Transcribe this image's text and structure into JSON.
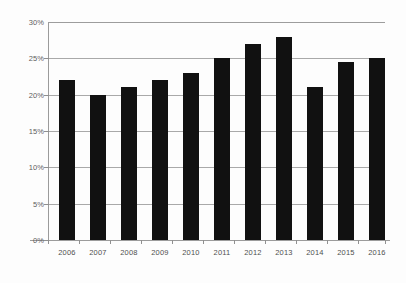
{
  "chart_data": {
    "type": "bar",
    "title": "",
    "subtitle": "",
    "xlabel": "",
    "ylabel": "",
    "categories": [
      "2006",
      "2007",
      "2008",
      "2009",
      "2010",
      "2011",
      "2012",
      "2013",
      "2014",
      "2015",
      "2016"
    ],
    "values": [
      22,
      20,
      21,
      22,
      23,
      25,
      27,
      28,
      21,
      24.5,
      25
    ],
    "value_labels": [
      "22%",
      "20%",
      "21%",
      "22%",
      "23%",
      "25%",
      "27%",
      "28%",
      "21%",
      "24.5%",
      "25%"
    ],
    "ylim": [
      0,
      30
    ],
    "ytick_values": [
      0,
      5,
      10,
      15,
      20,
      25,
      30
    ],
    "ytick_labels": [
      "0%",
      "5%",
      "10%",
      "15%",
      "20%",
      "25%",
      "30%"
    ],
    "grid": true,
    "grid_axis": "y",
    "legend": false,
    "legend_position": "none",
    "series": [
      {
        "name": "",
        "values": [
          22,
          20,
          21,
          22,
          23,
          25,
          27,
          28,
          21,
          24.5,
          25
        ]
      }
    ],
    "colors": {
      "bar": "#111111",
      "grid": "#a9a9a9",
      "axis": "#9b9b9b",
      "tick_label": "#5e5e5e",
      "background": "#fdfdfd"
    }
  }
}
